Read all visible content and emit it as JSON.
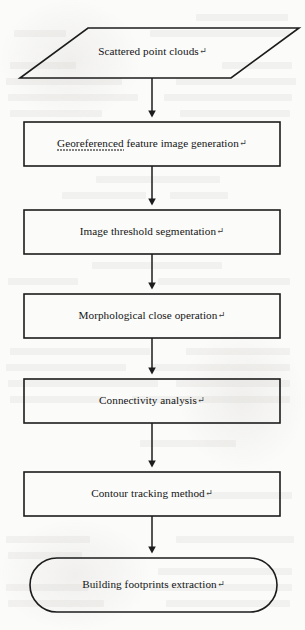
{
  "diagram": {
    "paragraph_mark": "↵",
    "stroke_color": "#1c1c1c",
    "background_color": "#fbfbfa",
    "nodes": [
      {
        "id": "scattered-point-clouds",
        "shape": "parallelogram",
        "role": "input",
        "label": "Scattered point clouds",
        "spellcheck_word": ""
      },
      {
        "id": "georeferenced-feature-image-generation",
        "shape": "rectangle",
        "role": "process",
        "label": "Georeferenced feature image generation",
        "spellcheck_word": "Georeferenced"
      },
      {
        "id": "image-threshold-segmentation",
        "shape": "rectangle",
        "role": "process",
        "label": "Image threshold segmentation",
        "spellcheck_word": ""
      },
      {
        "id": "morphological-close-operation",
        "shape": "rectangle",
        "role": "process",
        "label": "Morphological close operation",
        "spellcheck_word": ""
      },
      {
        "id": "connectivity-analysis",
        "shape": "rectangle",
        "role": "process",
        "label": "Connectivity analysis",
        "spellcheck_word": ""
      },
      {
        "id": "contour-tracking-method",
        "shape": "rectangle",
        "role": "process",
        "label": "Contour tracking method",
        "spellcheck_word": ""
      },
      {
        "id": "building-footprints-extraction",
        "shape": "stadium",
        "role": "terminator",
        "label": "Building footprints extraction",
        "spellcheck_word": ""
      }
    ],
    "connectors": [
      {
        "id": "arrow-1",
        "from": "scattered-point-clouds",
        "to": "georeferenced-feature-image-generation",
        "style": "solid-arrow-down"
      },
      {
        "id": "arrow-2",
        "from": "georeferenced-feature-image-generation",
        "to": "image-threshold-segmentation",
        "style": "solid-arrow-down"
      },
      {
        "id": "arrow-3",
        "from": "image-threshold-segmentation",
        "to": "morphological-close-operation",
        "style": "solid-arrow-down"
      },
      {
        "id": "arrow-4",
        "from": "morphological-close-operation",
        "to": "connectivity-analysis",
        "style": "solid-arrow-down"
      },
      {
        "id": "arrow-5",
        "from": "connectivity-analysis",
        "to": "contour-tracking-method",
        "style": "solid-arrow-down"
      },
      {
        "id": "arrow-6",
        "from": "contour-tracking-method",
        "to": "building-footprints-extraction",
        "style": "solid-arrow-down"
      }
    ]
  }
}
